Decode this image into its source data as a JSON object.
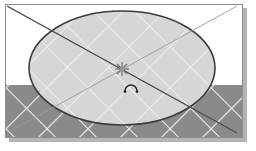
{
  "app": {
    "view_name": "3D Viewport",
    "frame_label": "drawing-frame"
  },
  "canvas": {
    "width": 256,
    "height": 151,
    "background_color": "#ffffff",
    "frame": {
      "x": 5,
      "y": 4,
      "width": 238,
      "height": 134,
      "border_color": "#8c8c8c",
      "fill_color": "#ffffff",
      "shadow_color": "#b4b4b4",
      "shadow_offset": 4
    }
  },
  "scene": {
    "title": "Cylinder top with construction diagonals",
    "type": "wireframe-shaded-3d",
    "ground": {
      "label": "ground-plane",
      "fill_color": "#8a8a8a",
      "top_edge_y": 84,
      "grid_color": "#f2f2f2",
      "grid_spacing": 29,
      "grid_angle_deg": 45
    },
    "disc": {
      "label": "cylinder-top-ellipse",
      "fill_color": "#d6d6d6",
      "outline_color": "#3c3c3c",
      "center_x": 121,
      "center_y": 67,
      "radius_x": 93,
      "radius_y": 57,
      "grid_color": "#efefef"
    },
    "diagonals": [
      {
        "label": "construction-line-primary",
        "color": "#4a4a4a",
        "x1": 6,
        "y1": 5,
        "x2": 236,
        "y2": 132,
        "width": 1.1
      },
      {
        "label": "construction-line-secondary",
        "color": "#9a9a9a",
        "x1": 236,
        "y1": 5,
        "x2": 6,
        "y2": 132,
        "width": 1.0
      }
    ],
    "center_marker": {
      "label": "center-snap-star",
      "symbol": "star-snap-icon",
      "color": "#6e6e6e",
      "x": 121,
      "y": 68,
      "size": 7
    },
    "arc_glyph": {
      "label": "arc-snap-indicator",
      "symbol": "arc-icon",
      "color": "#2c2c2c",
      "x": 130,
      "y": 86,
      "radius": 6
    }
  },
  "legend": {
    "shape_label": "Cylinder",
    "top_face_label": "Top face",
    "floor_label": "Grid floor"
  }
}
